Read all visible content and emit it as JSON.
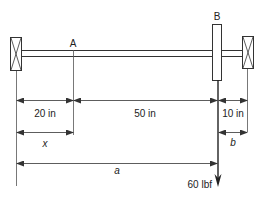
{
  "diagram": {
    "points": {
      "A": "A",
      "B": "B"
    },
    "dimensions": {
      "seg1": "20 in",
      "seg2": "50 in",
      "seg3": "10 in",
      "x": "x",
      "b": "b",
      "a": "a"
    },
    "load": {
      "label": "60 lbf"
    },
    "colors": {
      "stroke": "#333333",
      "text": "#222222"
    }
  }
}
